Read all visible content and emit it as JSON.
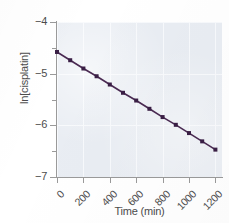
{
  "chart_data": {
    "type": "line",
    "title": "",
    "xlabel": "Time (min)",
    "ylabel": "ln[cisplatin]",
    "xlim": [
      0,
      1250
    ],
    "ylim": [
      -7,
      -4
    ],
    "grid": true,
    "legend": null,
    "series": [
      {
        "name": "ln[cisplatin]",
        "marker": "square",
        "color": "#4a2a52",
        "x": [
          0,
          100,
          200,
          300,
          400,
          500,
          600,
          700,
          800,
          900,
          1000,
          1100,
          1200
        ],
        "y": [
          -4.58,
          -4.74,
          -4.9,
          -5.05,
          -5.21,
          -5.37,
          -5.52,
          -5.68,
          -5.84,
          -5.99,
          -6.15,
          -6.31,
          -6.47
        ]
      }
    ],
    "xticks": [
      {
        "value": 0,
        "label": "0"
      },
      {
        "value": 200,
        "label": "200"
      },
      {
        "value": 400,
        "label": "400"
      },
      {
        "value": 600,
        "label": "600"
      },
      {
        "value": 800,
        "label": "800"
      },
      {
        "value": 1000,
        "label": "1000"
      },
      {
        "value": 1200,
        "label": "1200"
      }
    ],
    "yticks": [
      {
        "value": -4,
        "label": "−4"
      },
      {
        "value": -5,
        "label": "−5"
      },
      {
        "value": -6,
        "label": "−6"
      },
      {
        "value": -7,
        "label": "−7"
      }
    ],
    "yticks_minor": [
      -4.5,
      -5.5,
      -6.5
    ],
    "colors": {
      "plot_background": "#e9edf3",
      "gridline": "#f7f9fc",
      "axis": "#9a9a9a",
      "text": "#4c4c4c",
      "line": "#4a2a52",
      "marker": "#3a1f45"
    }
  }
}
